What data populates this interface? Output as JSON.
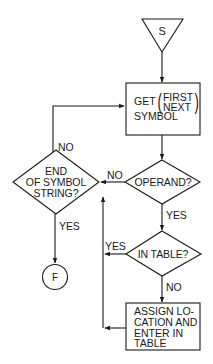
{
  "diagram": {
    "type": "flowchart",
    "nodes": {
      "start": {
        "label": "S",
        "shape": "triangle"
      },
      "get_symbol": {
        "prefix": "GET",
        "options": [
          "FIRST",
          "NEXT"
        ],
        "suffix": "SYMBOL",
        "shape": "rectangle"
      },
      "operand": {
        "label": "OPERAND?",
        "shape": "diamond"
      },
      "end_of_string": {
        "lines": [
          "END",
          "OF SYMBOL",
          "STRING?"
        ],
        "shape": "diamond"
      },
      "finish": {
        "label": "F",
        "shape": "circle"
      },
      "in_table": {
        "label": "IN TABLE?",
        "shape": "diamond"
      },
      "assign": {
        "lines": [
          "ASSIGN LO-",
          "CATION AND",
          "ENTER IN",
          "TABLE"
        ],
        "shape": "rectangle"
      }
    },
    "edge_labels": {
      "end_no": "NO",
      "operand_no": "NO",
      "end_yes": "YES",
      "operand_yes": "YES",
      "in_table_yes": "YES",
      "in_table_no": "NO"
    },
    "edges": [
      {
        "from": "start",
        "to": "get_symbol"
      },
      {
        "from": "get_symbol",
        "to": "operand"
      },
      {
        "from": "operand",
        "to": "end_of_string",
        "label": "NO"
      },
      {
        "from": "operand",
        "to": "in_table",
        "label": "YES"
      },
      {
        "from": "end_of_string",
        "to": "get_symbol",
        "label": "NO"
      },
      {
        "from": "end_of_string",
        "to": "finish",
        "label": "YES"
      },
      {
        "from": "in_table",
        "to": "end_of_string",
        "label": "YES"
      },
      {
        "from": "in_table",
        "to": "assign",
        "label": "NO"
      },
      {
        "from": "assign",
        "to": "end_of_string"
      }
    ],
    "colors": {
      "stroke": "#1a1a1a",
      "background": "#ffffff"
    }
  }
}
